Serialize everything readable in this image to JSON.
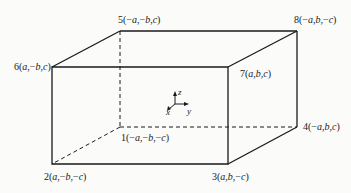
{
  "diagram": {
    "type": "rectangular-box-with-labeled-vertices",
    "line_color": "#1a1a1a",
    "vertices": [
      {
        "id": "1",
        "label": "1(−a,−b,−c)",
        "x": 120,
        "y": 127,
        "hidden": true
      },
      {
        "id": "2",
        "label": "2(a,−b,−c)",
        "x": 52,
        "y": 164,
        "hidden": false
      },
      {
        "id": "3",
        "label": "3(a,b,−c)",
        "x": 228,
        "y": 164,
        "hidden": false
      },
      {
        "id": "4",
        "label": "4(−a,b,c)",
        "x": 297,
        "y": 127,
        "hidden": false
      },
      {
        "id": "5",
        "label": "5(−a,−b,c)",
        "x": 120,
        "y": 31,
        "hidden": false
      },
      {
        "id": "6",
        "label": "6(a,−b,c)",
        "x": 52,
        "y": 67,
        "hidden": false
      },
      {
        "id": "7",
        "label": "7(a,b,c)",
        "x": 228,
        "y": 67,
        "hidden": false
      },
      {
        "id": "8",
        "label": "8(−a,b,−c)",
        "x": 297,
        "y": 31,
        "hidden": false
      }
    ],
    "axes": {
      "origin": {
        "x": 175,
        "y": 104
      },
      "labels": {
        "x": "x",
        "y": "y",
        "z": "z"
      }
    }
  }
}
